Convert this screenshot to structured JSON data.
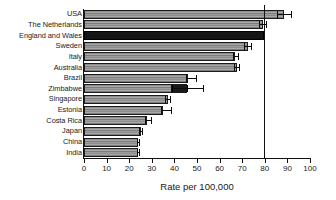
{
  "chart_data": {
    "type": "bar",
    "orientation": "horizontal",
    "title": "",
    "subtitle": "",
    "xlabel": "Rate per 100,000",
    "ylabel": "",
    "xlim": [
      0,
      100
    ],
    "xticks": [
      0,
      10,
      20,
      30,
      40,
      50,
      60,
      70,
      80,
      90,
      100
    ],
    "xtick_labels": [
      "0",
      "10",
      "20",
      "30",
      "40",
      "50",
      "60",
      "70",
      "80",
      "90",
      "100"
    ],
    "grid": false,
    "legend": null,
    "categories": [
      "USA",
      "The Netherlands",
      "England and Wales",
      "Sweden",
      "Italy",
      "Australia",
      "Brazil",
      "Zimbabwe",
      "Singapore",
      "Estonia",
      "Costa Rica",
      "Japan",
      "China",
      "India"
    ],
    "values": [
      88.5,
      79.0,
      79.5,
      72.5,
      67.0,
      67.5,
      46.0,
      45.5,
      37.0,
      35.0,
      28.0,
      25.0,
      24.0,
      24.0
    ],
    "error_low": [
      85.5,
      77.5,
      79.5,
      71.0,
      66.0,
      66.5,
      45.0,
      38.5,
      36.0,
      34.0,
      27.0,
      24.5,
      23.5,
      23.5
    ],
    "error_high": [
      91.5,
      80.5,
      79.5,
      74.0,
      68.0,
      68.5,
      49.5,
      52.5,
      38.0,
      38.5,
      29.5,
      25.5,
      24.5,
      24.5
    ],
    "highlight_index": 2,
    "highlight_label": "England and Wales",
    "reference_line": 79.5,
    "bar_fill": "#8d8d8d",
    "bar_edge": "#1c1c1c",
    "highlight_fill": "#141414",
    "axis_color": "#111111",
    "text_color": "#1a1a1a",
    "background": "#ffffff",
    "zimbabwe_inner_segment": {
      "start": 38.5,
      "end": 45.5
    }
  }
}
